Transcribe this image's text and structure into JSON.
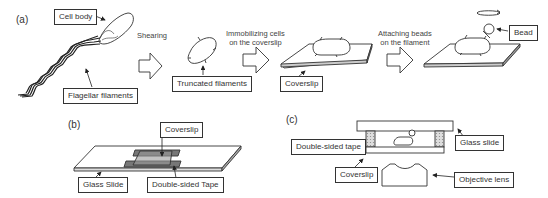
{
  "panels": {
    "a": {
      "label": "(a)",
      "labels": {
        "cell_body": "Cell body",
        "flagellar_filaments": "Flagellar filaments",
        "truncated_filaments": "Truncated filaments",
        "coverslip": "Coverslip",
        "bead": "Bead"
      },
      "steps": {
        "shearing": "Shearing",
        "immobilizing_1": "Immobilizing cells",
        "immobilizing_2": "on the coverslip",
        "attaching_1": "Attaching beads",
        "attaching_2": "on the filament"
      }
    },
    "b": {
      "label": "(b)",
      "labels": {
        "coverslip": "Coverslip",
        "glass_slide": "Glass Slide",
        "double_sided_tape": "Double-sided Tape"
      }
    },
    "c": {
      "label": "(c)",
      "labels": {
        "double_sided_tape": "Double-sided tape",
        "glass_slide": "Glass slide",
        "coverslip": "Coverslip",
        "objective_lens": "Objective  lens"
      }
    }
  },
  "colors": {
    "line": "#333333",
    "tape": "#777777",
    "tape_hatch": "#bbbbbb"
  }
}
